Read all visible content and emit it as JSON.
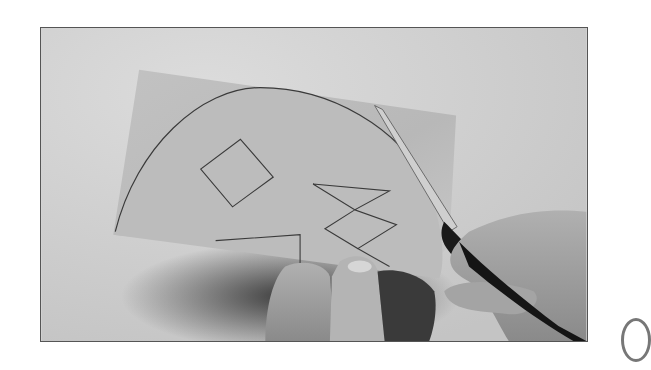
{
  "photo": {
    "subject": "hands cutting paper with scissors",
    "style": "grayscale photograph",
    "colors": {
      "background": "#d4d4d4",
      "paper": "#bdbdbd",
      "outline": "#3a3a3a",
      "skin": "#a8a8a8",
      "scissors": "#1a1a1a",
      "frame_border": "#555555"
    },
    "drawn_shapes": [
      "semicircle-outline",
      "diamond-square",
      "zigzag-bowtie",
      "angled-line"
    ]
  },
  "page_edge_marker": {
    "shape": "partial-circle"
  }
}
